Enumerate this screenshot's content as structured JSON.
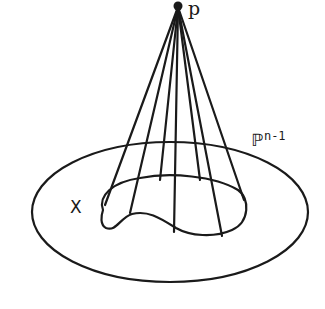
{
  "figure": {
    "labels": {
      "apex": "p",
      "variety": "X",
      "space_symbol": "ℙ",
      "space_exponent": "n-1"
    },
    "colors": {
      "stroke": "#1a1a1a",
      "background": "#ffffff"
    }
  }
}
